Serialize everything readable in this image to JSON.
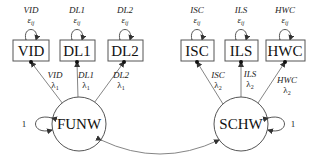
{
  "diagram": {
    "type": "structural-equation-model",
    "latent_factors": [
      {
        "id": "funw",
        "label": "FUNW",
        "variance_label": "1"
      },
      {
        "id": "schw",
        "label": "SCHW",
        "variance_label": "1"
      }
    ],
    "indicators": [
      {
        "id": "vid",
        "label": "VID",
        "error_name": "VID",
        "error_symbol": "ε",
        "error_sub": "ij",
        "loading_name": "VID",
        "loading_symbol": "λ",
        "loading_sub": "1",
        "factor": "FUNW"
      },
      {
        "id": "dl1",
        "label": "DL1",
        "error_name": "DL1",
        "error_symbol": "ε",
        "error_sub": "ij",
        "loading_name": "DL1",
        "loading_symbol": "λ",
        "loading_sub": "1",
        "factor": "FUNW"
      },
      {
        "id": "dl2",
        "label": "DL2",
        "error_name": "DL2",
        "error_symbol": "ε",
        "error_sub": "ij",
        "loading_name": "DL2",
        "loading_symbol": "λ",
        "loading_sub": "1",
        "factor": "FUNW"
      },
      {
        "id": "isc",
        "label": "ISC",
        "error_name": "ISC",
        "error_symbol": "ε",
        "error_sub": "ij",
        "loading_name": "ISC",
        "loading_symbol": "λ",
        "loading_sub": "2",
        "factor": "SCHW"
      },
      {
        "id": "ils",
        "label": "ILS",
        "error_name": "ILS",
        "error_symbol": "ε",
        "error_sub": "ij",
        "loading_name": "ILS",
        "loading_symbol": "λ",
        "loading_sub": "2",
        "factor": "SCHW"
      },
      {
        "id": "hwc",
        "label": "HWC",
        "error_name": "HWC",
        "error_symbol": "ε",
        "error_sub": "ij",
        "loading_name": "HWC",
        "loading_symbol": "λ",
        "loading_sub": "2",
        "factor": "SCHW"
      }
    ],
    "covariance": {
      "from": "FUNW",
      "to": "SCHW",
      "label": ""
    }
  }
}
